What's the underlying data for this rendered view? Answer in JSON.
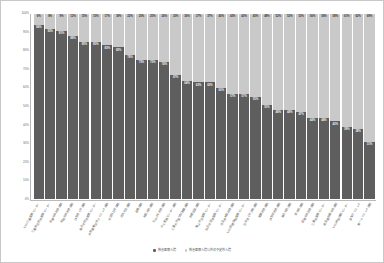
{
  "chart_data": {
    "type": "bar",
    "subtype": "stacked-100-percent",
    "title": "",
    "xlabel": "",
    "ylabel": "",
    "ylim": [
      0,
      100
    ],
    "yticks": [
      "0%",
      "10%",
      "20%",
      "30%",
      "40%",
      "50%",
      "60%",
      "70%",
      "80%",
      "90%",
      "100%"
    ],
    "ytick_values": [
      0,
      10,
      20,
      30,
      40,
      50,
      60,
      70,
      80,
      90,
      100
    ],
    "grid": false,
    "legend_position": "bottom",
    "colors": {
      "series_1": "#5e5e5e",
      "series_2": "#c9c9c9",
      "axis": "#b9b9b9",
      "tick_text": "#6b6b6b"
    },
    "series": [
      {
        "name": "救急医療入院",
        "color": "#5e5e5e",
        "values": [
          94,
          92,
          91,
          88,
          85,
          85,
          83,
          82,
          78,
          75,
          75,
          74,
          67,
          64,
          63,
          63,
          60,
          57,
          57,
          55,
          51,
          48,
          48,
          47,
          44,
          44,
          42,
          39,
          38,
          31
        ]
      },
      {
        "name": "救急医療入院以外の予定外入院",
        "color": "#c9c9c9",
        "values": [
          6,
          8,
          9,
          12,
          15,
          15,
          17,
          18,
          22,
          25,
          25,
          26,
          33,
          36,
          37,
          37,
          40,
          43,
          43,
          45,
          49,
          52,
          52,
          53,
          56,
          56,
          58,
          61,
          62,
          69
        ]
      }
    ],
    "categories": [
      "NHO三重医療センター",
      "三重県立総合医療センター",
      "鈴鹿中央総合病院",
      "松阪中央総合病院",
      "伊勢赤十字病院",
      "桑名市総合医療センター",
      "伊勢慶應記念クリニック病院",
      "市立四日市病院",
      "名張市立病院",
      "紀南病院",
      "松阪市民病院",
      "なのはな総合病院",
      "みえ医療センター病院",
      "三重大学医学部附属病院",
      "鈴鹿回生病院",
      "亀山市立医療センター",
      "四日市羽津医療センター",
      "済生会松阪総合病院",
      "NHO鈴鹿病院医療センター",
      "日本赤十字伊勢病院",
      "尾鷲総合病院",
      "伊勢湾総合病院",
      "桑名市民病院",
      "津市民病院",
      "紀南中央総合病院",
      "三重北医療センター",
      "厚生連鈴鹿中央病院",
      "NHO榊原病院センター",
      "愛知クリニック",
      "第一クリニック病院"
    ],
    "top_labels": [
      "6%",
      "8%",
      "9%",
      "12%",
      "15%",
      "15%",
      "17%",
      "18%",
      "22%",
      "25%",
      "25%",
      "26%",
      "33%",
      "36%",
      "37%",
      "37%",
      "40%",
      "43%",
      "43%",
      "45%",
      "49%",
      "52%",
      "52%",
      "53%",
      "56%",
      "56%",
      "58%",
      "61%",
      "62%",
      "69%"
    ],
    "bottom_labels": [
      "94%",
      "92%",
      "91%",
      "88%",
      "85%",
      "85%",
      "83%",
      "82%",
      "78%",
      "75%",
      "75%",
      "74%",
      "67%",
      "64%",
      "63%",
      "63%",
      "60%",
      "57%",
      "57%",
      "55%",
      "51%",
      "48%",
      "48%",
      "47%",
      "44%",
      "44%",
      "42%",
      "39%",
      "38%",
      "31%"
    ]
  }
}
